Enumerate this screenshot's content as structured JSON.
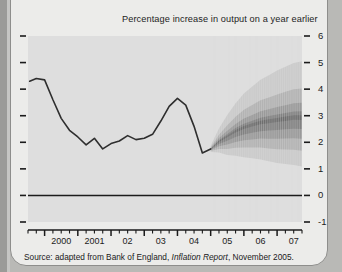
{
  "title": "Percentage increase in output on a year earlier",
  "source": {
    "prefix": "Source: adapted from Bank of England,",
    "italic": "Inflation Report",
    "suffix": ", November 2005."
  },
  "colors": {
    "page_background": "#b9b9b6",
    "card_background": "#ececea",
    "plot_background": "#dedede",
    "line": "#2e2e2e",
    "fan": "#4a4a4a",
    "axis": "#1b1b1b"
  },
  "chart_data": {
    "type": "line",
    "title": "Percentage increase in output on a year earlier",
    "xlabel": "",
    "ylabel": "Percentage increase in output on a year earlier",
    "ylim": [
      -1,
      6
    ],
    "yticks": [
      -1,
      0,
      1,
      2,
      3,
      4,
      5,
      6
    ],
    "ytick_labels": [
      "-1",
      "0",
      "1",
      "2",
      "3",
      "4",
      "5",
      "6"
    ],
    "xlim": [
      1999.5,
      2007.75
    ],
    "xticks": [
      2000,
      2001,
      2002,
      2003,
      2004,
      2005,
      2006,
      2007
    ],
    "xtick_labels": [
      "2000",
      "2001",
      "02",
      "03",
      "04",
      "05",
      "06",
      "07"
    ],
    "minor_xticks_per_year": 4,
    "grid": false,
    "legend": null,
    "zero_line": 0,
    "forecast_start": 2005.0,
    "series": [
      {
        "name": "GDP growth (history)",
        "type": "line",
        "x": [
          1999.55,
          1999.75,
          2000.0,
          2000.25,
          2000.5,
          2000.75,
          2001.0,
          2001.25,
          2001.5,
          2001.75,
          2002.0,
          2002.25,
          2002.5,
          2002.75,
          2003.0,
          2003.25,
          2003.5,
          2003.75,
          2004.0,
          2004.25,
          2004.5,
          2004.75,
          2005.0
        ],
        "values": [
          4.3,
          4.4,
          4.35,
          3.6,
          2.9,
          2.45,
          2.2,
          1.9,
          2.15,
          1.75,
          1.95,
          2.05,
          2.25,
          2.1,
          2.15,
          2.3,
          2.8,
          3.35,
          3.65,
          3.4,
          2.6,
          1.6,
          1.75
        ]
      },
      {
        "name": "GDP growth fan (forecast central)",
        "type": "fan",
        "x": [
          2005.0,
          2005.25,
          2005.5,
          2005.75,
          2006.0,
          2006.25,
          2006.5,
          2006.75,
          2007.0,
          2007.25,
          2007.5,
          2007.75
        ],
        "central": [
          1.75,
          2.05,
          2.25,
          2.45,
          2.6,
          2.7,
          2.8,
          2.85,
          2.9,
          2.95,
          3.0,
          3.0
        ],
        "bands": [
          {
            "probability": 10,
            "lower_offset": 0.12,
            "upper_offset": 0.12
          },
          {
            "probability": 30,
            "lower_offset": 0.38,
            "upper_offset": 0.38
          },
          {
            "probability": 50,
            "lower_offset": 0.66,
            "upper_offset": 0.66
          },
          {
            "probability": 70,
            "lower_offset": 1.0,
            "upper_offset": 1.0
          },
          {
            "probability": 90,
            "lower_offset": 1.45,
            "upper_offset": 1.55
          }
        ],
        "spread_growth": [
          0.08,
          0.3,
          0.5,
          0.66,
          0.8,
          0.9,
          1.0,
          1.08,
          1.16,
          1.22,
          1.28,
          1.32
        ]
      }
    ]
  }
}
